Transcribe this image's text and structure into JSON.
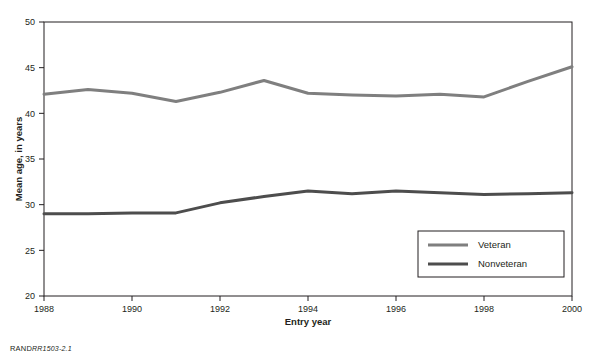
{
  "figure": {
    "source_note_prefix": "RAND",
    "source_note_id": "RR1503-2.1"
  },
  "chart_data": {
    "type": "line",
    "title": "",
    "xlabel": "Entry year",
    "ylabel": "Mean age, in years",
    "xlim": [
      1988,
      2000
    ],
    "ylim": [
      20,
      50
    ],
    "xticks": [
      1988,
      1990,
      1992,
      1994,
      1996,
      1998,
      2000
    ],
    "xticklabels": [
      "1988",
      "1990",
      "1992",
      "1994",
      "1996",
      "1998",
      "2000"
    ],
    "yticks": [
      20,
      25,
      30,
      35,
      40,
      45,
      50
    ],
    "yticklabels": [
      "20",
      "25",
      "30",
      "35",
      "40",
      "45",
      "50"
    ],
    "grid": false,
    "legend_position": "lower right",
    "x": [
      1988,
      1989,
      1990,
      1991,
      1992,
      1993,
      1994,
      1995,
      1996,
      1997,
      1998,
      1999,
      2000
    ],
    "series": [
      {
        "name": "Veteran",
        "color": "#7f7f7f",
        "values": [
          42.1,
          42.6,
          42.2,
          41.3,
          42.3,
          43.6,
          42.2,
          42.0,
          41.9,
          42.1,
          41.8,
          43.5,
          45.1
        ]
      },
      {
        "name": "Nonveteran",
        "color": "#4d4d4d",
        "values": [
          29.0,
          29.0,
          29.1,
          29.1,
          30.2,
          30.9,
          31.5,
          31.2,
          31.5,
          31.3,
          31.1,
          31.2,
          31.3
        ]
      }
    ],
    "legend": [
      {
        "label": "Veteran",
        "color": "#7f7f7f"
      },
      {
        "label": "Nonveteran",
        "color": "#4d4d4d"
      }
    ]
  }
}
